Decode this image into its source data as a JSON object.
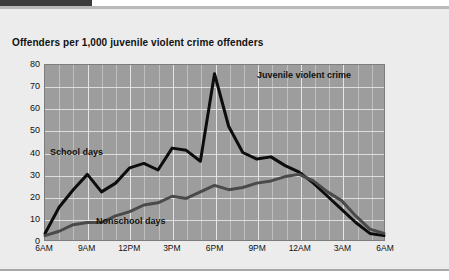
{
  "window": {
    "tab_accent_color": "#3c3c3c",
    "panel_background": "#ececec"
  },
  "chart_title": "Offenders per 1,000 juvenile violent crime offenders",
  "annotations": {
    "school_days": "School days",
    "nonschool_days": "Nonschool days",
    "top_right": "Juvenile violent crime"
  },
  "colors": {
    "plot_background": "#9d9d9d",
    "gridline": "#e9e9e9",
    "school_days_line": "#0d0d0d",
    "nonschool_days_line": "#4a4a4a"
  },
  "chart_data": {
    "type": "line",
    "title": "Offenders per 1,000 juvenile violent crime offenders",
    "xlabel": "",
    "ylabel": "Offenders per 1,000 juvenile violent crime offenders",
    "ylim": [
      0,
      80
    ],
    "yticks": [
      0,
      10,
      20,
      30,
      40,
      50,
      60,
      70,
      80
    ],
    "grid": true,
    "legend_position": "inline-annotations",
    "xlim": [
      0,
      24
    ],
    "x": [
      0,
      1,
      2,
      3,
      4,
      5,
      6,
      7,
      8,
      9,
      10,
      11,
      12,
      13,
      14,
      15,
      16,
      17,
      18,
      19,
      20,
      21,
      22,
      23,
      24
    ],
    "xtick_positions": [
      0,
      3,
      6,
      9,
      12,
      15,
      18,
      21,
      24
    ],
    "xticklabels": [
      "6AM",
      "9AM",
      "12PM",
      "3PM",
      "6PM",
      "9PM",
      "12AM",
      "3AM",
      "6AM"
    ],
    "series": [
      {
        "name": "School days",
        "color": "#0d0d0d",
        "values": [
          3,
          15,
          23,
          30,
          22,
          26,
          33,
          35,
          32,
          42,
          41,
          36,
          76,
          52,
          40,
          37,
          38,
          34,
          31,
          26,
          20,
          14,
          8,
          3,
          2
        ]
      },
      {
        "name": "Nonschool days",
        "color": "#4a4a4a",
        "values": [
          2,
          4,
          7,
          8,
          8,
          11,
          13,
          16,
          17,
          20,
          19,
          22,
          25,
          23,
          24,
          26,
          27,
          29,
          30,
          27,
          22,
          18,
          11,
          5,
          3
        ]
      }
    ]
  }
}
